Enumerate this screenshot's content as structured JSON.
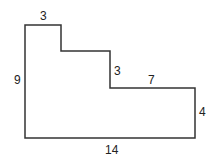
{
  "diagram": {
    "type": "rectilinear-polygon",
    "stroke_color": "#333333",
    "vertices": [
      [
        25,
        25
      ],
      [
        61,
        25
      ],
      [
        61,
        51
      ],
      [
        110,
        51
      ],
      [
        110,
        88
      ],
      [
        195,
        88
      ],
      [
        195,
        138
      ],
      [
        25,
        138
      ]
    ],
    "labels": {
      "top_width": "3",
      "left_height": "9",
      "step_height": "3",
      "right_top_width": "7",
      "right_height": "4",
      "bottom_width": "14"
    }
  }
}
